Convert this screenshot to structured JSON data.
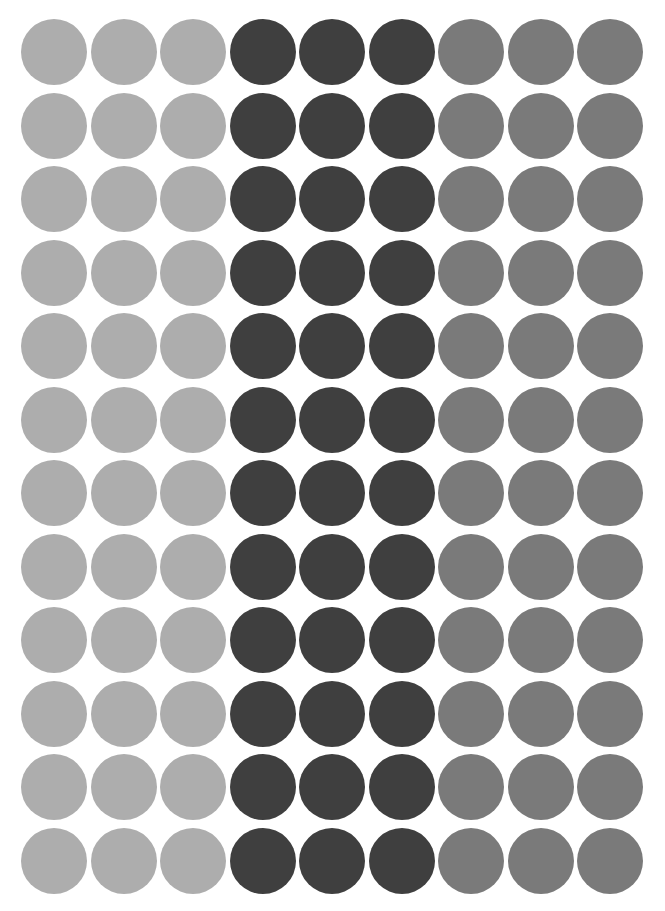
{
  "sheet": {
    "description": "Grid of filled circles in three gray tones",
    "rows": 12,
    "columns": 9,
    "circle_diameter_px": 66,
    "origin_center_px": [
      54,
      52
    ],
    "pitch_px": [
      69.5,
      73.5
    ],
    "background": "#ffffff",
    "column_groups": [
      {
        "name": "light-gray",
        "columns": [
          0,
          1,
          2
        ],
        "color": "#adadad"
      },
      {
        "name": "dark-gray",
        "columns": [
          3,
          4,
          5
        ],
        "color": "#3f3f3f"
      },
      {
        "name": "medium-gray",
        "columns": [
          6,
          7,
          8
        ],
        "color": "#7a7a7a"
      }
    ]
  }
}
